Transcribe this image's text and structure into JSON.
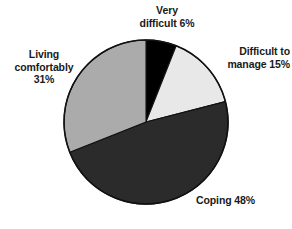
{
  "chart_data": {
    "type": "pie",
    "title": "",
    "subtitle": "",
    "xlabel": "",
    "ylabel": "",
    "legend_position": "none",
    "grid": false,
    "units": "percent",
    "start_angle_deg": 0,
    "direction": "clockwise",
    "center": {
      "x": 146,
      "y": 122
    },
    "radius": 82,
    "outline_color": "#111111",
    "categories": [
      "Very difficult",
      "Difficult to manage",
      "Coping",
      "Living comfortably"
    ],
    "values": [
      6,
      15,
      48,
      31
    ],
    "slices": [
      {
        "name": "Very difficult",
        "value": 6,
        "value_text": "6%",
        "label": "Very\ndifficult 6%",
        "color": "#000000",
        "start_deg": 0,
        "end_deg": 21.6
      },
      {
        "name": "Difficult to manage",
        "value": 15,
        "value_text": "15%",
        "label": "Difficult to\nmanage 15%",
        "color": "#e8e8e8",
        "start_deg": 21.6,
        "end_deg": 75.6
      },
      {
        "name": "Coping",
        "value": 48,
        "value_text": "48%",
        "label": "Coping 48%",
        "color": "#2b2b2b",
        "start_deg": 75.6,
        "end_deg": 248.4
      },
      {
        "name": "Living comfortably",
        "value": 31,
        "value_text": "31%",
        "label": "Living\ncomfortably\n31%",
        "color": "#ababab",
        "start_deg": 248.4,
        "end_deg": 360
      }
    ]
  },
  "labels": {
    "very_difficult": "Very\ndifficult 6%",
    "difficult_to_manage": "Difficult to\nmanage 15%",
    "coping": "Coping 48%",
    "living_comfortably": "Living\ncomfortably\n31%"
  }
}
